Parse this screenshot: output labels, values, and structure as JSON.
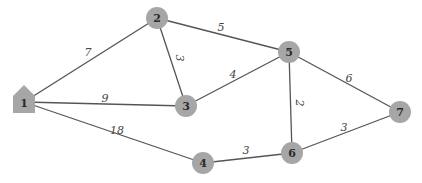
{
  "diagram": {
    "type": "weighted-undirected-graph",
    "nodes": [
      {
        "id": "1",
        "label": "1",
        "shape": "house",
        "x": 24,
        "y": 102
      },
      {
        "id": "2",
        "label": "2",
        "shape": "circle",
        "x": 157,
        "y": 18
      },
      {
        "id": "3",
        "label": "3",
        "shape": "circle",
        "x": 186,
        "y": 106
      },
      {
        "id": "4",
        "label": "4",
        "shape": "circle",
        "x": 203,
        "y": 163
      },
      {
        "id": "5",
        "label": "5",
        "shape": "circle",
        "x": 289,
        "y": 52
      },
      {
        "id": "6",
        "label": "6",
        "shape": "circle",
        "x": 292,
        "y": 153
      },
      {
        "id": "7",
        "label": "7",
        "shape": "circle",
        "x": 400,
        "y": 112
      }
    ],
    "edges": [
      {
        "from": "1",
        "to": "2",
        "weight": "7",
        "lx": 88,
        "ly": 52,
        "rot": 0
      },
      {
        "from": "1",
        "to": "3",
        "weight": "9",
        "lx": 105,
        "ly": 98,
        "rot": 0
      },
      {
        "from": "1",
        "to": "4",
        "weight": "18",
        "lx": 117,
        "ly": 130,
        "rot": 0
      },
      {
        "from": "2",
        "to": "3",
        "weight": "3",
        "lx": 179,
        "ly": 58,
        "rot": 90
      },
      {
        "from": "2",
        "to": "5",
        "weight": "5",
        "lx": 221,
        "ly": 27,
        "rot": 0
      },
      {
        "from": "3",
        "to": "5",
        "weight": "4",
        "lx": 233,
        "ly": 74,
        "rot": 0
      },
      {
        "from": "5",
        "to": "6",
        "weight": "2",
        "lx": 299,
        "ly": 103,
        "rot": 90
      },
      {
        "from": "5",
        "to": "7",
        "weight": "6",
        "lx": 349,
        "ly": 78,
        "rot": 0
      },
      {
        "from": "4",
        "to": "6",
        "weight": "3",
        "lx": 246,
        "ly": 150,
        "rot": 0
      },
      {
        "from": "6",
        "to": "7",
        "weight": "3",
        "lx": 344,
        "ly": 127,
        "rot": 0
      }
    ],
    "colors": {
      "node_fill": "#a6a6a6",
      "edge_stroke": "#555555",
      "label_text": "#2a2a2a"
    }
  }
}
